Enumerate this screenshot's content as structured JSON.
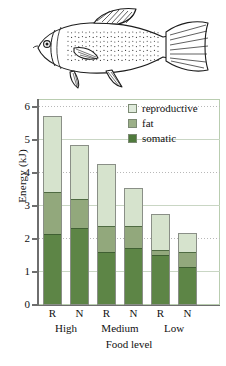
{
  "figure": {
    "illustration": {
      "name": "fish-line-drawing",
      "caption": ""
    }
  },
  "legend": {
    "position": "top-right-inside",
    "items": [
      {
        "key": "reproductive",
        "label": "reproductive",
        "color": "#dfeadb"
      },
      {
        "key": "fat",
        "label": "fat",
        "color": "#9cb088"
      },
      {
        "key": "somatic",
        "label": "somatic",
        "color": "#4f7a3c"
      }
    ]
  },
  "axes": {
    "y_title": "Energy (kJ)",
    "x_title": "Food level",
    "y_ticks": [
      "0",
      "1",
      "2",
      "3",
      "4",
      "5",
      "6"
    ],
    "x_ticks": [
      "R",
      "N",
      "R",
      "N",
      "R",
      "N"
    ],
    "x_groups": [
      "High",
      "Medium",
      "Low"
    ]
  },
  "chart_data": {
    "type": "bar",
    "title": "",
    "subtitle": "",
    "xlabel": "Food level",
    "ylabel": "Energy (kJ)",
    "ylim": [
      0,
      6
    ],
    "yticks": [
      0,
      1,
      2,
      3,
      4,
      5,
      6
    ],
    "grid": true,
    "stacked": true,
    "legend_position": "top-right-inside",
    "categories": [
      "R",
      "N",
      "R",
      "N",
      "R",
      "N"
    ],
    "groups": [
      {
        "name": "High",
        "categories": [
          "R",
          "N"
        ]
      },
      {
        "name": "Medium",
        "categories": [
          "R",
          "N"
        ]
      },
      {
        "name": "Low",
        "categories": [
          "R",
          "N"
        ]
      }
    ],
    "series": [
      {
        "name": "somatic",
        "color": "#5d8546",
        "values": [
          2.05,
          2.25,
          1.55,
          1.65,
          1.45,
          1.1
        ]
      },
      {
        "name": "fat",
        "color": "#92a87c",
        "values": [
          1.25,
          0.85,
          0.75,
          0.65,
          0.15,
          0.45
        ]
      },
      {
        "name": "reproductive",
        "color": "#d6e3cd",
        "values": [
          2.2,
          1.55,
          1.8,
          1.1,
          1.05,
          0.55
        ]
      }
    ],
    "totals": [
      5.5,
      4.65,
      4.1,
      3.4,
      2.65,
      2.1
    ]
  },
  "bars": [
    {
      "tick": "R",
      "group": "High",
      "somatic": 2.05,
      "fat": 1.25,
      "reproductive": 2.2,
      "total": 5.5
    },
    {
      "tick": "N",
      "group": "High",
      "somatic": 2.25,
      "fat": 0.85,
      "reproductive": 1.55,
      "total": 4.65
    },
    {
      "tick": "R",
      "group": "Medium",
      "somatic": 1.55,
      "fat": 0.75,
      "reproductive": 1.8,
      "total": 4.1
    },
    {
      "tick": "N",
      "group": "Medium",
      "somatic": 1.65,
      "fat": 0.65,
      "reproductive": 1.1,
      "total": 3.4
    },
    {
      "tick": "R",
      "group": "Low",
      "somatic": 1.45,
      "fat": 0.15,
      "reproductive": 1.05,
      "total": 2.65
    },
    {
      "tick": "N",
      "group": "Low",
      "somatic": 1.1,
      "fat": 0.45,
      "reproductive": 0.55,
      "total": 2.1
    }
  ],
  "colors": {
    "reproductive": "#d6e3cd",
    "fat": "#92a87c",
    "somatic": "#5d8546",
    "frame": "#b9cdb0",
    "axis": "#6e6e6e"
  }
}
